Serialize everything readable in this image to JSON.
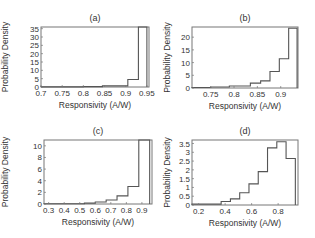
{
  "chart_data": [
    {
      "type": "bar",
      "subtype": "histogram-stairs",
      "title": "(a)",
      "xlabel": "Responsivity (A/W)",
      "ylabel": "Probability Density",
      "xlim": [
        0.7,
        0.955
      ],
      "ylim": [
        0,
        36
      ],
      "xticks": [
        0.7,
        0.75,
        0.8,
        0.85,
        0.9,
        0.95
      ],
      "xtick_labels": [
        "0.7",
        "0.75",
        "0.8",
        "0.85",
        "0.9",
        "0.95"
      ],
      "yticks": [
        0,
        5,
        10,
        15,
        20,
        25,
        30,
        35
      ],
      "ytick_labels": [
        "0",
        "5",
        "10",
        "15",
        "20",
        "25",
        "30",
        "35"
      ],
      "bin_edges": [
        0.7,
        0.75,
        0.8,
        0.845,
        0.905,
        0.93,
        0.95
      ],
      "values": [
        0.1,
        0.1,
        0.2,
        0.7,
        4.5,
        36
      ],
      "grid": false
    },
    {
      "type": "bar",
      "subtype": "histogram-stairs",
      "title": "(b)",
      "xlabel": "Responsivity (A/W)",
      "ylabel": "Probability Density",
      "xlim": [
        0.71,
        0.937
      ],
      "ylim": [
        0,
        24
      ],
      "xticks": [
        0.75,
        0.8,
        0.85,
        0.9
      ],
      "xtick_labels": [
        "0.75",
        "0.8",
        "0.85",
        "0.9"
      ],
      "yticks": [
        0,
        5,
        10,
        15,
        20
      ],
      "ytick_labels": [
        "0",
        "5",
        "10",
        "15",
        "20"
      ],
      "bin_edges": [
        0.71,
        0.75,
        0.79,
        0.835,
        0.857,
        0.877,
        0.897,
        0.917,
        0.935
      ],
      "values": [
        0.2,
        0.4,
        0.8,
        1.9,
        2.8,
        6.5,
        11.5,
        23.5
      ],
      "grid": false
    },
    {
      "type": "bar",
      "subtype": "histogram-stairs",
      "title": "(c)",
      "xlabel": "Responsivity (A/W)",
      "ylabel": "Probability Density",
      "xlim": [
        0.27,
        0.965
      ],
      "ylim": [
        0,
        11
      ],
      "xticks": [
        0.3,
        0.4,
        0.5,
        0.6,
        0.7,
        0.8,
        0.9
      ],
      "xtick_labels": [
        "0.3",
        "0.4",
        "0.5",
        "0.6",
        "0.7",
        "0.8",
        "0.9"
      ],
      "yticks": [
        0,
        2,
        4,
        6,
        8,
        10
      ],
      "ytick_labels": [
        "0",
        "2",
        "4",
        "6",
        "8",
        "10"
      ],
      "bin_edges": [
        0.27,
        0.53,
        0.6,
        0.67,
        0.74,
        0.81,
        0.88,
        0.95
      ],
      "values": [
        0.05,
        0.15,
        0.35,
        0.7,
        1.4,
        3.0,
        11.0
      ],
      "grid": false
    },
    {
      "type": "bar",
      "subtype": "histogram-stairs",
      "title": "(d)",
      "xlabel": "Responsivity (A/W)",
      "ylabel": "Probability Density",
      "xlim": [
        0.15,
        0.95
      ],
      "ylim": [
        0,
        3.7
      ],
      "xticks": [
        0.2,
        0.4,
        0.6,
        0.8
      ],
      "xtick_labels": [
        "0.2",
        "0.4",
        "0.6",
        "0.8"
      ],
      "yticks": [
        0,
        0.5,
        1,
        1.5,
        2,
        2.5,
        3,
        3.5
      ],
      "ytick_labels": [
        "0",
        "0.5",
        "1",
        "1.5",
        "2",
        "2.5",
        "3",
        "3.5"
      ],
      "bin_edges": [
        0.15,
        0.37,
        0.44,
        0.51,
        0.58,
        0.65,
        0.72,
        0.79,
        0.86,
        0.93
      ],
      "values": [
        0.05,
        0.2,
        0.35,
        0.7,
        1.2,
        1.9,
        3.25,
        3.6,
        2.65
      ],
      "grid": false
    }
  ],
  "panels": [
    {
      "id": "a",
      "frame": [
        41,
        27,
        149,
        87
      ]
    },
    {
      "id": "b",
      "frame": [
        192,
        27,
        298,
        88
      ]
    },
    {
      "id": "c",
      "frame": [
        44,
        140,
        152,
        204
      ]
    },
    {
      "id": "d",
      "frame": [
        192,
        140,
        298,
        205
      ]
    }
  ],
  "colors": {
    "line": "#555555",
    "frame": "#777777",
    "text": "#333333"
  }
}
